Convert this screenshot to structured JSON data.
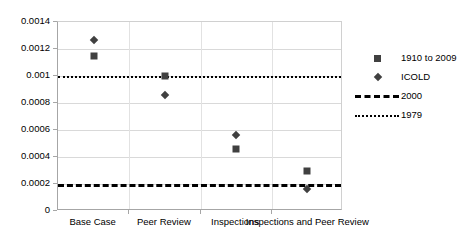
{
  "chart_data": {
    "type": "scatter",
    "title": "",
    "subtitle": "",
    "xlabel": "",
    "ylabel": "",
    "categories": [
      "Base Case",
      "Peer Review",
      "Inspections",
      "Inspections and Peer Review"
    ],
    "ylim": [
      0,
      0.0014
    ],
    "yticks": [
      0,
      0.0002,
      0.0004,
      0.0006,
      0.0008,
      0.001,
      0.0012,
      0.0014
    ],
    "ytick_labels": [
      "0",
      "0.0002",
      "0.0004",
      "0.0006",
      "0.0008",
      "0.001",
      "0.0012",
      "0.0014"
    ],
    "grid": true,
    "legend_position": "right",
    "series": [
      {
        "name": "1910 to 2009",
        "marker": "square",
        "color": "#404040",
        "values": [
          0.00115,
          0.001,
          0.00046,
          0.0003
        ]
      },
      {
        "name": "ICOLD",
        "marker": "diamond",
        "color": "#404040",
        "values": [
          0.00127,
          0.00086,
          0.00056,
          0.00016
        ]
      }
    ],
    "reference_lines": [
      {
        "name": "2000",
        "style": "dashed",
        "color": "#000000",
        "value": 0.0002
      },
      {
        "name": "1979",
        "style": "dotted",
        "color": "#000000",
        "value": 0.001
      }
    ]
  },
  "legend": {
    "entries": [
      {
        "label": "1910 to 2009",
        "key": "square-marker-icon"
      },
      {
        "label": "ICOLD",
        "key": "diamond-marker-icon"
      },
      {
        "label": "2000",
        "key": "dashed-line-icon"
      },
      {
        "label": "1979",
        "key": "dotted-line-icon"
      }
    ]
  },
  "axes": {
    "y_tick_labels": [
      "0.0014",
      "0.0012",
      "0.001",
      "0.0008",
      "0.0006",
      "0.0004",
      "0.0002",
      "0"
    ],
    "x_category_labels": [
      "Base Case",
      "Peer Review",
      "Inspections",
      "Inspections and Peer Review"
    ]
  }
}
